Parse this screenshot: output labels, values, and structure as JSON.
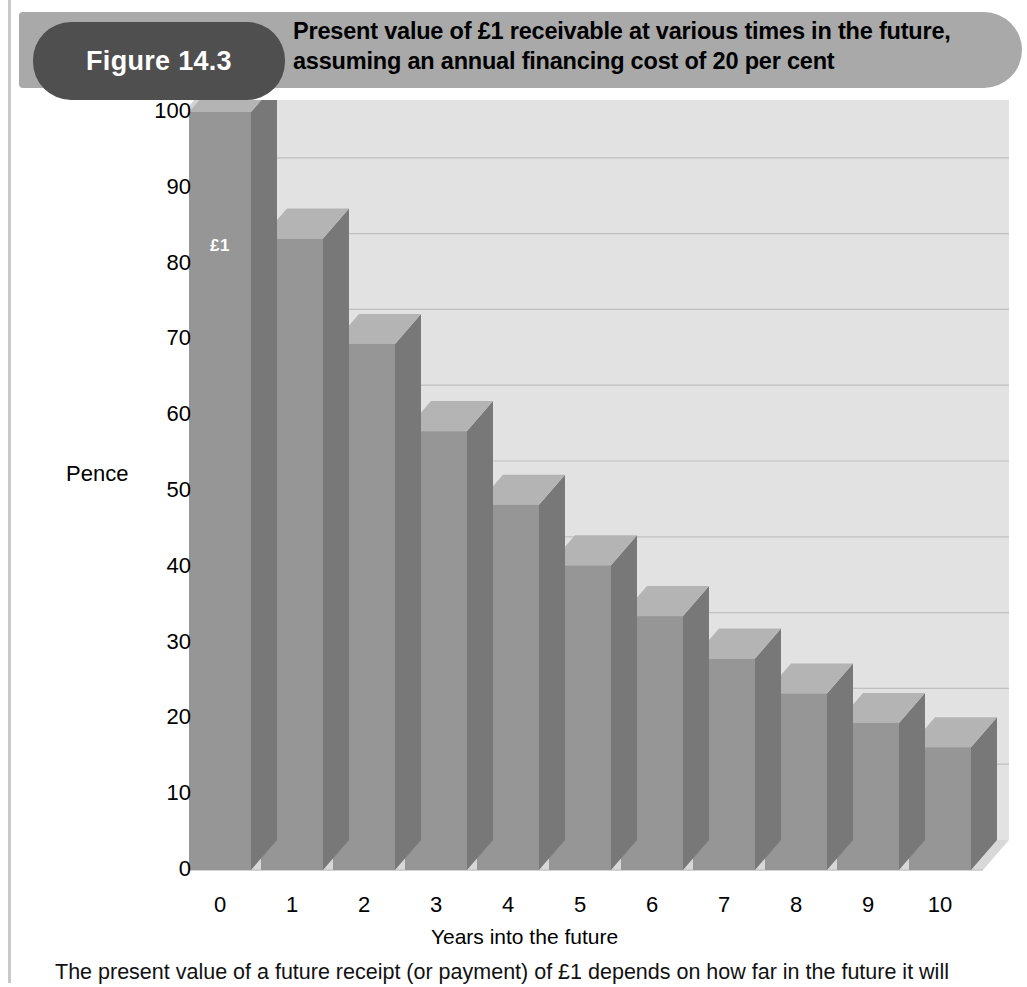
{
  "figure": {
    "badge_label": "Figure 14.3",
    "title_line1": "Present value of £1 receivable at various times in the future,",
    "title_line2": "assuming an annual financing cost of 20 per cent",
    "caption": "The present value of a future receipt (or payment) of £1 depends on how far in the future it will",
    "badge_color": "#4f4f4f",
    "header_band_color": "#a9a9a9",
    "plot_bg_color": "#e2e2e2",
    "bar_face_color": "#969696",
    "bar_side_color": "#787878",
    "bar_top_color": "#b4b4b4"
  },
  "chart_data": {
    "type": "bar",
    "title": "Present value of £1 receivable at various times in the future, assuming an annual financing cost of 20 per cent",
    "xlabel": "Years into the future",
    "ylabel": "Pence",
    "categories": [
      "0",
      "1",
      "2",
      "3",
      "4",
      "5",
      "6",
      "7",
      "8",
      "9",
      "10"
    ],
    "values": [
      100,
      83.3,
      69.4,
      57.9,
      48.2,
      40.2,
      33.5,
      27.9,
      23.3,
      19.4,
      16.2
    ],
    "ylim": [
      0,
      100
    ],
    "yticks": [
      0,
      10,
      20,
      30,
      40,
      50,
      60,
      70,
      80,
      90,
      100
    ],
    "ytick_labels": [
      "0",
      "10",
      "20",
      "30",
      "40",
      "50",
      "60",
      "70",
      "80",
      "90",
      "100"
    ],
    "xtick_labels": [
      "0",
      "1",
      "2",
      "3",
      "4",
      "5",
      "6",
      "7",
      "8",
      "9",
      "10"
    ],
    "grid": true,
    "legend": "none",
    "annotations": [
      {
        "series_index": 0,
        "text": "£1"
      }
    ],
    "style": "3d-column"
  }
}
